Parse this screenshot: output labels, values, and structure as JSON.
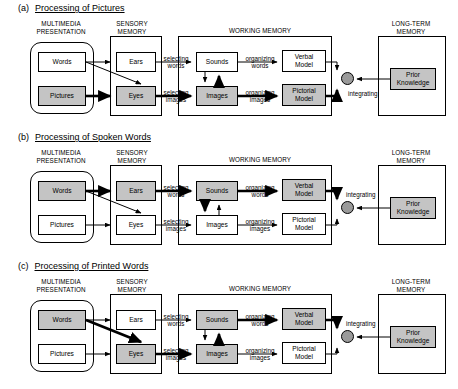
{
  "figure": {
    "colors": {
      "shaded_fill": "#c4c4c4",
      "node_fill": "#ffffff",
      "stroke": "#000000",
      "integrating_node_fill": "#9a9a9a"
    }
  },
  "region_labels": {
    "multimedia_presentation": "MULTIMEDIA\nPRESENTATION",
    "sensory_memory": "SENSORY\nMEMORY",
    "working_memory": "WORKING MEMORY",
    "long_term_memory": "LONG-TERM\nMEMORY"
  },
  "node_labels": {
    "words": "Words",
    "pictures": "Pictures",
    "ears": "Ears",
    "eyes": "Eyes",
    "sounds": "Sounds",
    "images": "Images",
    "verbal_model": "Verbal\nModel",
    "pictorial_model": "Pictorial\nModel",
    "prior_knowledge": "Prior\nKnowledge"
  },
  "process_labels": {
    "selecting_words": "selecting\nwords",
    "selecting_images": "selecting\nimages",
    "organizing_words": "organizing\nwords",
    "organizing_images": "organizing\nimages",
    "integrating": "integrating"
  },
  "panels": [
    {
      "letter": "(a)",
      "title": "Processing of Pictures",
      "shaded_nodes": [
        "pictures",
        "eyes",
        "images",
        "pictorial_model",
        "prior_knowledge"
      ],
      "bold_edges": [
        "pictures-eyes",
        "eyes-images",
        "images-pictorial_model",
        "images-sounds-up"
      ]
    },
    {
      "letter": "(b)",
      "title": "Processing of Spoken Words",
      "shaded_nodes": [
        "words",
        "ears",
        "sounds",
        "verbal_model",
        "prior_knowledge"
      ],
      "bold_edges": [
        "words-ears",
        "ears-sounds",
        "sounds-verbal_model",
        "sounds-images-down"
      ]
    },
    {
      "letter": "(c)",
      "title": "Processing of Printed Words",
      "shaded_nodes": [
        "words",
        "eyes",
        "sounds",
        "images",
        "verbal_model",
        "prior_knowledge"
      ],
      "bold_edges": [
        "words-eyes",
        "eyes-images",
        "images-sounds-up",
        "sounds-verbal_model"
      ]
    }
  ]
}
